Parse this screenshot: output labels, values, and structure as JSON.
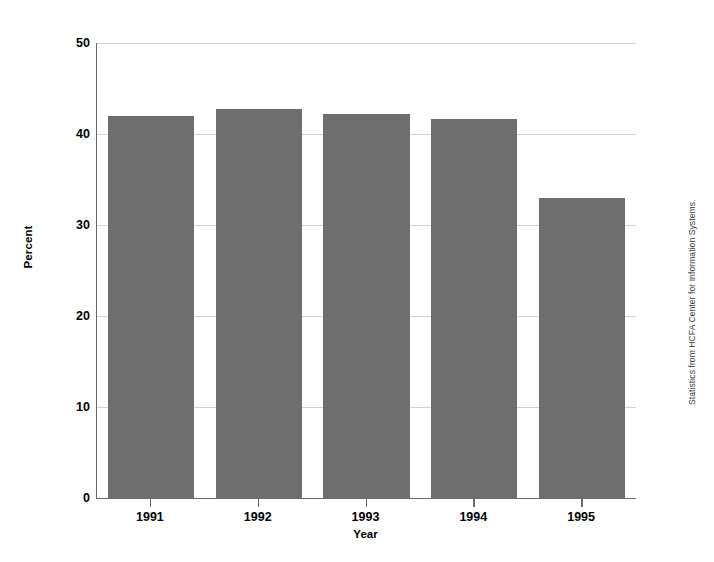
{
  "chart_data": {
    "type": "bar",
    "title": "",
    "subtitle": "",
    "xlabel": "Year",
    "ylabel": "Percent",
    "categories": [
      "1991",
      "1992",
      "1993",
      "1994",
      "1995"
    ],
    "values": [
      42.0,
      42.8,
      42.2,
      41.6,
      33.0
    ],
    "series": [
      {
        "name": "Percent",
        "values": [
          42.0,
          42.8,
          42.2,
          41.6,
          33.0
        ]
      }
    ],
    "ylim": [
      0,
      50
    ],
    "y_ticks": [
      0,
      10,
      20,
      30,
      40,
      50
    ],
    "y_tick_labels": [
      "0",
      "10",
      "20",
      "30",
      "40",
      "50"
    ],
    "x_tick_labels": [
      "1991",
      "1992",
      "1993",
      "1994",
      "1995"
    ],
    "grid": true,
    "grid_axis": "y",
    "legend": false,
    "legend_position": "none",
    "bar_color": "#6e6e6e",
    "grid_color": "#d2d2d2",
    "axis_color": "#6a6a6a",
    "background_color": "#ffffff",
    "annotations": [
      {
        "name": "source-note",
        "text": "Statistics from HCFA Center for Information Systems.",
        "position": "right-vertical"
      }
    ]
  },
  "axes": {
    "y_title": "Percent",
    "x_title": "Year"
  },
  "caption": {
    "source_note": "Statistics from HCFA Center for Information Systems."
  }
}
